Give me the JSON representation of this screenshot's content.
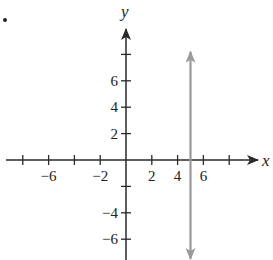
{
  "chart_data": {
    "type": "line",
    "title": "",
    "xlabel": "x",
    "ylabel": "y",
    "xlim": [
      -9,
      10
    ],
    "ylim": [
      -7.6,
      10
    ],
    "grid": false,
    "x_ticks": [
      -8,
      -6,
      -4,
      -2,
      2,
      4,
      6,
      8
    ],
    "x_tick_labels": [
      "",
      "−6",
      "",
      "−2",
      "2",
      "4",
      "6",
      ""
    ],
    "y_ticks": [
      8,
      6,
      4,
      2,
      -2,
      -4,
      -6
    ],
    "y_tick_labels": [
      "",
      "6",
      "4",
      "2",
      "",
      "−4",
      "−6"
    ],
    "series": [
      {
        "name": "vertical line x = 5",
        "equation": "x = 5",
        "color": "#9a9a9a",
        "points": [
          {
            "x": 5,
            "y": 8.2
          },
          {
            "x": 5,
            "y": -7.5
          }
        ],
        "arrows": "both"
      }
    ],
    "annotations": [
      {
        "text": ".",
        "position": "top-left"
      }
    ]
  },
  "layout": {
    "origin_px": [
      126,
      160
    ],
    "unit_px_x": 12.9,
    "unit_px_y": 13.2,
    "axis_color": "#2a2a2a",
    "line_color": "#9a9a9a"
  }
}
